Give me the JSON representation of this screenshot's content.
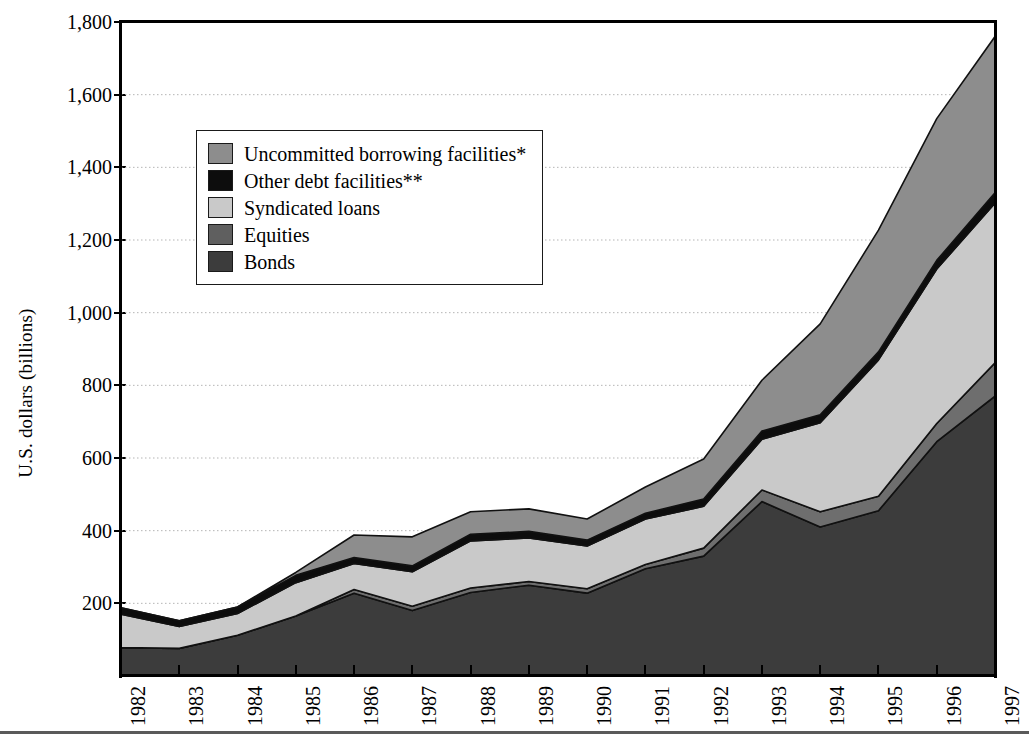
{
  "chart_data": {
    "type": "area",
    "stacked": true,
    "title": "",
    "xlabel": "",
    "ylabel": "U.S. dollars (billions)",
    "ylim": [
      0,
      1800
    ],
    "ytick_step": 200,
    "grid": true,
    "legend_position": "inside-upper-left",
    "categories": [
      "1982",
      "1983",
      "1984",
      "1985",
      "1986",
      "1987",
      "1988",
      "1989",
      "1990",
      "1991",
      "1992",
      "1993",
      "1994",
      "1995",
      "1996",
      "1997"
    ],
    "series": [
      {
        "name": "Bonds",
        "color": "#3c3c3c",
        "values": [
          78,
          76,
          112,
          165,
          228,
          180,
          230,
          250,
          228,
          295,
          330,
          480,
          410,
          455,
          645,
          770
        ]
      },
      {
        "name": "Equities",
        "color": "#6e6e6e",
        "values": [
          0,
          0,
          0,
          0,
          10,
          12,
          12,
          10,
          12,
          12,
          22,
          32,
          42,
          40,
          50,
          92
        ]
      },
      {
        "name": "Syndicated loans",
        "color": "#c9c9c9",
        "values": [
          92,
          60,
          60,
          92,
          72,
          95,
          130,
          120,
          118,
          125,
          115,
          140,
          245,
          375,
          425,
          440
        ]
      },
      {
        "name": "Other debt facilities**",
        "color": "#0d0d0d",
        "values": [
          18,
          16,
          18,
          20,
          16,
          16,
          18,
          18,
          16,
          16,
          20,
          22,
          22,
          22,
          24,
          28
        ]
      },
      {
        "name": "Uncommitted borrowing facilities*",
        "color": "#8d8d8d",
        "values": [
          0,
          0,
          0,
          8,
          62,
          80,
          62,
          62,
          58,
          72,
          110,
          140,
          250,
          335,
          390,
          430
        ]
      }
    ],
    "totals": [
      188,
      152,
      190,
      285,
      388,
      383,
      452,
      460,
      432,
      520,
      597,
      814,
      969,
      1227,
      1534,
      1760
    ],
    "yticks": [
      200,
      400,
      600,
      800,
      1000,
      1200,
      1400,
      1600,
      1800
    ],
    "ytick_labels": [
      "200",
      "400",
      "600",
      "800",
      "1,000",
      "1,200",
      "1,400",
      "1,600",
      "1,800"
    ]
  },
  "axes": {
    "y_title": "U.S. dollars (billions)"
  },
  "legend": {
    "items": [
      {
        "label": "Uncommitted borrowing facilities*",
        "color": "#8d8d8d"
      },
      {
        "label": "Other debt facilities**",
        "color": "#0d0d0d"
      },
      {
        "label": "Syndicated loans",
        "color": "#c9c9c9"
      },
      {
        "label": "Equities",
        "color": "#5f5f5f"
      },
      {
        "label": "Bonds",
        "color": "#3c3c3c"
      }
    ]
  }
}
